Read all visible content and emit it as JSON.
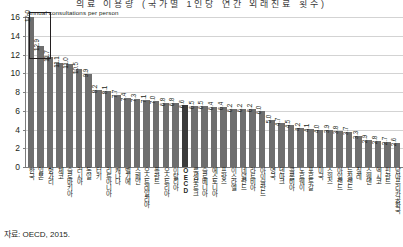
{
  "title": "의료 이용량 (국가별 1인당 연간 외래진료 횟수)",
  "axis_note": "Annual consultations per person",
  "source": "자료: OECD, 2015.",
  "colors": {
    "bar": "#6e6e6e",
    "bar_highlight": "#3b3b3b",
    "grid": "#d3d3d3",
    "axis": "#7d7d7d"
  },
  "chart_data": {
    "type": "bar",
    "title": "Annual consultations per person",
    "xlabel": "",
    "ylabel": "Annual consultations per person",
    "ylim": [
      0,
      16
    ],
    "yticks": [
      0,
      2,
      4,
      6,
      8,
      10,
      12,
      14,
      16
    ],
    "grid": true,
    "legend": "none",
    "highlight_category": "OECD",
    "categories": [
      "한국",
      "일본",
      "헝가리",
      "체코",
      "슬로바키아",
      "러시아",
      "독일",
      "터키",
      "리투아니아",
      "캐나다",
      "벨기에",
      "스페인",
      "오스트레일리아",
      "폴란드",
      "오스트리아",
      "이탈리아",
      "OECD",
      "룩셈부르크",
      "슬로베니아",
      "에스토니아",
      "프랑스",
      "이스라엘",
      "네덜란드",
      "라트비아",
      "아이슬란드",
      "영국",
      "덴마크",
      "콜롬비아",
      "노르웨이",
      "포르투갈",
      "미국",
      "스위스",
      "아일랜드",
      "뉴질랜드",
      "칠레",
      "스웨덴",
      "멕시코",
      "핀란드",
      "남아프리카공화국"
    ],
    "values": [
      16.0,
      12.9,
      11.7,
      11.1,
      11.0,
      10.5,
      9.9,
      8.2,
      8.1,
      7.7,
      7.4,
      7.3,
      7.1,
      7.0,
      6.8,
      6.8,
      6.6,
      6.5,
      6.5,
      6.4,
      6.4,
      6.2,
      6.2,
      6.2,
      6.0,
      5.0,
      4.7,
      4.5,
      4.2,
      4.1,
      4.0,
      3.9,
      3.8,
      3.7,
      3.3,
      2.9,
      2.8,
      2.7,
      2.6
    ],
    "value_labels": [
      "16.0",
      "12.9",
      "11.7",
      "11.1",
      "11.0",
      "10.5",
      "9.9",
      "8.2",
      "8.1",
      "7.7",
      "7.4",
      "7.3",
      "7.1",
      "7.0",
      "6.8",
      "6.8",
      "6.6",
      "6.5",
      "6.5",
      "6.4",
      "6.4",
      "6.2",
      "6.2",
      "6.2",
      "6.0",
      "5.0",
      "4.7",
      "4.5",
      "4.2",
      "4.1",
      "4.0",
      "3.9",
      "3.8",
      "3.7",
      "3.3",
      "2.9",
      "2.8",
      "2.7",
      "2.6"
    ]
  }
}
